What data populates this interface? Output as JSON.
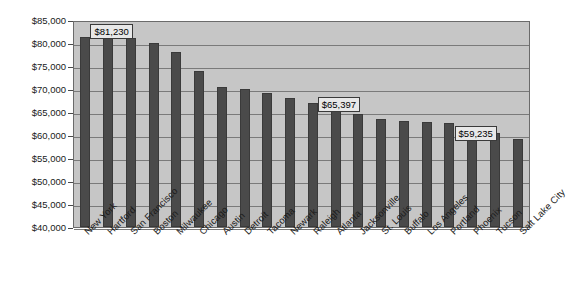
{
  "chart_data": {
    "type": "bar",
    "title": "",
    "subtitle": "",
    "xlabel": "",
    "ylabel": "",
    "ylim": [
      40000,
      85000
    ],
    "ytick_step": 5000,
    "ytick_labels": [
      "$85,000",
      "$80,000",
      "$75,000",
      "$70,000",
      "$65,000",
      "$60,000",
      "$55,000",
      "$50,000",
      "$45,000",
      "$40,000"
    ],
    "grid": true,
    "legend": "none",
    "bar_color": "#4a4a4a",
    "plot_background": "#c6c6c6",
    "categories": [
      "New York",
      "Hartford",
      "San Francisco",
      "Boston",
      "Milwaukee",
      "Chicago",
      "Austin",
      "Detroit",
      "Tacoma",
      "Newark",
      "Raleigh",
      "Atlanta",
      "Jacksonville",
      "St. Louis",
      "Buffalo",
      "Los Angeles",
      "Portland",
      "Phoenix",
      "Tucson",
      "Salt Lake City"
    ],
    "values": [
      81230,
      81230,
      81000,
      80000,
      78100,
      74000,
      70500,
      70000,
      69200,
      68000,
      67000,
      65397,
      64600,
      63400,
      63000,
      62800,
      62600,
      62000,
      60500,
      59235
    ],
    "annotations": [
      {
        "category": "New York",
        "value": 81230,
        "label": "$81,230"
      },
      {
        "category": "Atlanta",
        "value": 65397,
        "label": "$65,397"
      },
      {
        "category": "Salt Lake City",
        "value": 59235,
        "label": "$59,235"
      }
    ]
  }
}
